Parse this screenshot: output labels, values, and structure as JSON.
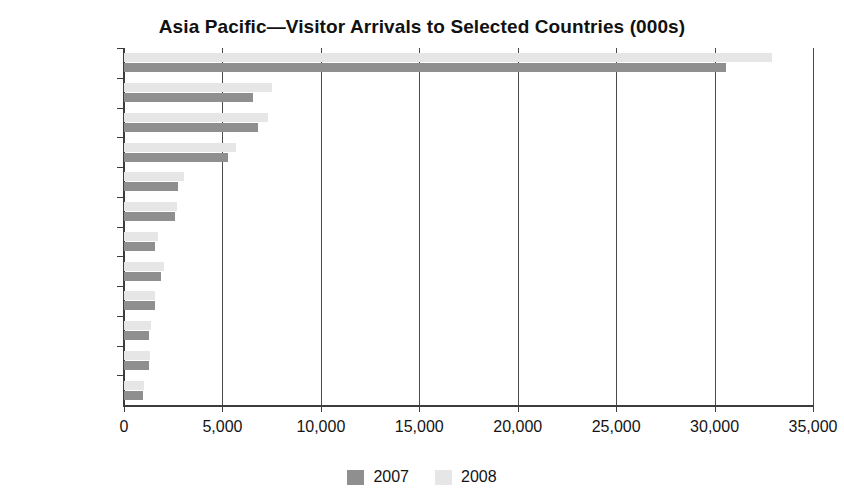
{
  "chart_data": {
    "type": "bar",
    "orientation": "horizontal",
    "title": "Asia Pacific—Visitor Arrivals to Selected Countries (000s)",
    "xlabel": "",
    "ylabel": "",
    "xlim": [
      0,
      35000
    ],
    "xticks": [
      0,
      5000,
      10000,
      15000,
      20000,
      25000,
      30000,
      35000
    ],
    "xtick_labels": [
      "0",
      "5,000",
      "10,000",
      "15,000",
      "20,000",
      "25,000",
      "30,000",
      "35,000"
    ],
    "grid": true,
    "legend_position": "bottom",
    "categories": [
      "China (PRC)",
      "Macau",
      "Hong Kong",
      "Malaysia",
      "Thailand",
      "Singapore",
      "India",
      "Japan",
      "Australia",
      "Indonesia",
      "Vietnam",
      "Philippines"
    ],
    "series": [
      {
        "name": "2007",
        "color": "#8f8f8f",
        "values": [
          30600,
          6550,
          6800,
          5300,
          2750,
          2600,
          1600,
          1900,
          1550,
          1250,
          1250,
          960
        ]
      },
      {
        "name": "2008",
        "color": "#e6e6e6",
        "values": [
          32900,
          7500,
          7300,
          5700,
          3050,
          2700,
          1750,
          2050,
          1600,
          1350,
          1300,
          1000
        ]
      }
    ]
  },
  "legend": {
    "items": [
      {
        "label": "2007",
        "color": "#8f8f8f"
      },
      {
        "label": "2008",
        "color": "#e6e6e6"
      }
    ]
  }
}
